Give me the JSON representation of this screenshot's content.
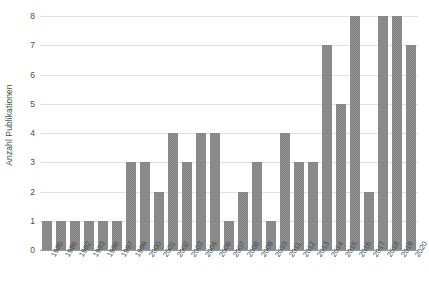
{
  "chart_data": {
    "type": "bar",
    "title": "",
    "subtitle": "",
    "xlabel": "",
    "ylabel": "Anzahl Publikationen",
    "categories": [
      "1985",
      "1986",
      "1992",
      "1993",
      "1996",
      "1997",
      "1999",
      "2000",
      "2001",
      "2002",
      "2003",
      "2004",
      "2006",
      "2007",
      "2008",
      "2009",
      "2010",
      "2011",
      "2012",
      "2013",
      "2014",
      "2015",
      "2016",
      "2017",
      "2018",
      "2019",
      "2020"
    ],
    "values": [
      1,
      1,
      1,
      1,
      1,
      1,
      3,
      3,
      2,
      4,
      3,
      4,
      4,
      1,
      2,
      3,
      1,
      4,
      3,
      3,
      7,
      5,
      8,
      2,
      8,
      8,
      7
    ],
    "series": [
      {
        "name": "Anzahl Publikationen",
        "values": [
          1,
          1,
          1,
          1,
          1,
          1,
          3,
          3,
          2,
          4,
          3,
          4,
          4,
          1,
          2,
          3,
          1,
          4,
          3,
          3,
          7,
          5,
          8,
          2,
          8,
          8,
          7
        ]
      }
    ],
    "ylim": [
      0,
      8
    ],
    "yticks": [
      0,
      1,
      2,
      3,
      4,
      5,
      6,
      7,
      8
    ],
    "ytick_labels": [
      "0",
      "1",
      "2",
      "3",
      "4",
      "5",
      "6",
      "7",
      "8"
    ],
    "xlim_categories": 27,
    "grid": true,
    "grid_axis": "y",
    "legend": false,
    "legend_position": "none",
    "bar_color": "#808080",
    "gridline_color": "#e2e2e2",
    "axis_color": "#9a9a9a",
    "text_color": "#4d4d4d",
    "background_color": "#ffffff",
    "annotations": []
  }
}
